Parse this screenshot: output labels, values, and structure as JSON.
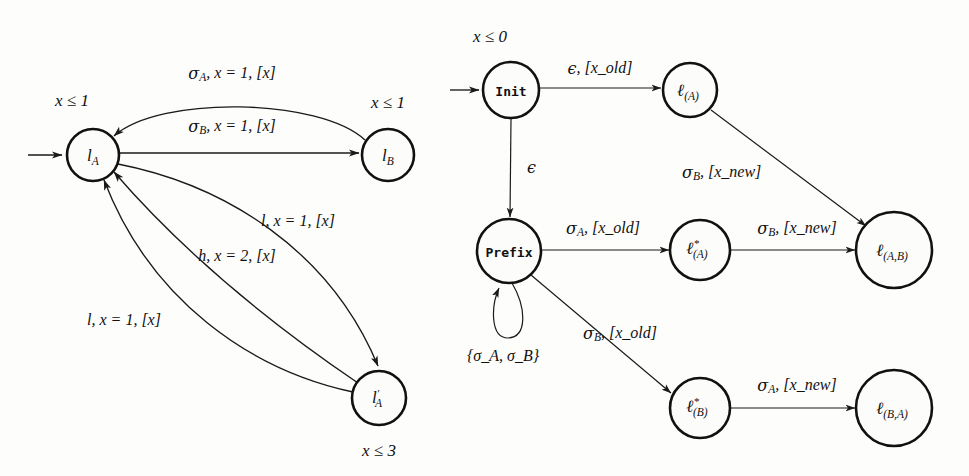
{
  "figure": {
    "background_color": "#fdfdfc",
    "ink_color": "#111111"
  },
  "left_diagram": {
    "name": "original-timed-automaton",
    "nodes": [
      {
        "id": "lA",
        "label_base": "l",
        "label_sub": "A",
        "label_prime": "",
        "invariant": "x ≤ 1",
        "cx": 93,
        "cy": 155,
        "r": 26,
        "inv_x": 72,
        "inv_y": 102
      },
      {
        "id": "lB",
        "label_base": "l",
        "label_sub": "B",
        "label_prime": "",
        "invariant": "x ≤ 1",
        "cx": 388,
        "cy": 155,
        "r": 26,
        "inv_x": 388,
        "inv_y": 104
      },
      {
        "id": "lAprime",
        "label_base": "l",
        "label_sub": "A",
        "label_prime": "′",
        "invariant": "x ≤ 3",
        "cx": 379,
        "cy": 398,
        "r": 27,
        "inv_x": 379,
        "inv_y": 452
      }
    ],
    "edge_labels": [
      {
        "id": "sigmaA-top",
        "text": "σ_A, x = 1, [x]",
        "sigma": "σ",
        "sigma_sub": "A",
        "rest": ", x = 1, [x]",
        "x": 232,
        "y": 74
      },
      {
        "id": "sigmaB-mid",
        "text": "σ_B, x = 1, [x]",
        "sigma": "σ",
        "sigma_sub": "B",
        "rest": ", x = 1, [x]",
        "x": 232,
        "y": 127
      },
      {
        "id": "l-right",
        "text": "l, x = 1, [x]",
        "x": 298,
        "y": 222
      },
      {
        "id": "h-mid",
        "text": "h, x = 2, [x]",
        "x": 237,
        "y": 257
      },
      {
        "id": "l-bottom",
        "text": "l, x = 1, [x]",
        "x": 124,
        "y": 321
      }
    ],
    "initial_arrow": {
      "from_x": 28,
      "from_y": 155,
      "to_x": 64,
      "to_y": 155
    }
  },
  "right_diagram": {
    "name": "prefix-tree-automaton",
    "nodes": [
      {
        "id": "Init",
        "label": "Init",
        "style": "mono",
        "invariant": "x ≤ 0",
        "cx": 511,
        "cy": 90,
        "r": 28,
        "inv_x": 490,
        "inv_y": 38
      },
      {
        "id": "Prefix",
        "label": "Prefix",
        "style": "mono",
        "invariant": "",
        "cx": 509,
        "cy": 251,
        "r": 32,
        "inv_x": 0,
        "inv_y": 0
      },
      {
        "id": "lA1",
        "label_base": "ℓ",
        "label_sub": "(A)",
        "star": false,
        "style": "script",
        "cx": 690,
        "cy": 90,
        "r": 27
      },
      {
        "id": "lAstar",
        "label_base": "ℓ",
        "label_sub": "(A)",
        "star": true,
        "style": "script",
        "cx": 700,
        "cy": 250,
        "r": 30
      },
      {
        "id": "lAB",
        "label_base": "ℓ",
        "label_sub": "(A,B)",
        "star": false,
        "style": "script",
        "cx": 894,
        "cy": 250,
        "r": 38
      },
      {
        "id": "lBstar",
        "label_base": "ℓ",
        "label_sub": "(B)",
        "star": true,
        "style": "script",
        "cx": 700,
        "cy": 408,
        "r": 30
      },
      {
        "id": "lBA",
        "label_base": "ℓ",
        "label_sub": "(B,A)",
        "star": false,
        "style": "script",
        "cx": 894,
        "cy": 408,
        "r": 38
      }
    ],
    "edge_labels": [
      {
        "id": "eps-xold",
        "prefix": "ϵ",
        "rest": ", [x_old]",
        "x": 600,
        "y": 69,
        "anchor": "middle"
      },
      {
        "id": "eps-vertical",
        "prefix": "ϵ",
        "rest": "",
        "x": 527,
        "y": 168,
        "anchor": "start"
      },
      {
        "id": "sigmaB-xnew-dg",
        "sigma": "σ",
        "sigma_sub": "B",
        "rest": ", [x_new]",
        "x": 682,
        "y": 173,
        "anchor": "start"
      },
      {
        "id": "sigmaA-xold",
        "sigma": "σ",
        "sigma_sub": "A",
        "rest": ", [x_old]",
        "x": 603,
        "y": 229,
        "anchor": "middle"
      },
      {
        "id": "sigmaB-xnew",
        "sigma": "σ",
        "sigma_sub": "B",
        "rest": ", [x_new]",
        "x": 797,
        "y": 229,
        "anchor": "middle"
      },
      {
        "id": "sigmaB-xold",
        "sigma": "σ",
        "sigma_sub": "B",
        "rest": ", [x_old]",
        "x": 620,
        "y": 334,
        "anchor": "middle"
      },
      {
        "id": "sigmaA-xnew",
        "sigma": "σ",
        "sigma_sub": "A",
        "rest": ", [x_new]",
        "x": 797,
        "y": 386,
        "anchor": "middle"
      },
      {
        "id": "selfloop-set",
        "text": "{σ_A, σ_B}",
        "x": 503,
        "y": 357,
        "anchor": "middle"
      }
    ],
    "initial_arrow": {
      "from_x": 450,
      "from_y": 90,
      "to_x": 481,
      "to_y": 90
    }
  },
  "symbols": {
    "sigma": "σ",
    "epsilon": "ϵ",
    "ell": "ℓ",
    "leq": "≤",
    "star": "*",
    "prime": "′"
  }
}
